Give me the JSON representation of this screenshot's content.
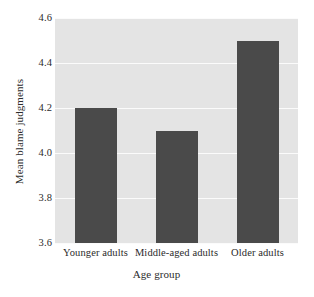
{
  "chart_data": {
    "type": "bar",
    "title": "",
    "categories": [
      "Younger adults",
      "Middle-aged adults",
      "Older adults"
    ],
    "values": [
      4.2,
      4.1,
      4.5
    ],
    "xlabel": "Age group",
    "ylabel": "Mean blame judgments",
    "ylim": [
      3.6,
      4.6
    ],
    "yticks": [
      "4.6",
      "4.4",
      "4.2",
      "4.0",
      "3.8",
      "3.6"
    ],
    "ytick_values": [
      4.6,
      4.4,
      4.2,
      4.0,
      3.8,
      3.6
    ],
    "grid": true,
    "legend": null
  },
  "style": {
    "bar_color": "#4a4a4a",
    "plot_background": "#e4e4e4",
    "gridline_color": "#fbfbfb",
    "figure_background": "#ffffff",
    "text_color": "#2b2b2b"
  }
}
